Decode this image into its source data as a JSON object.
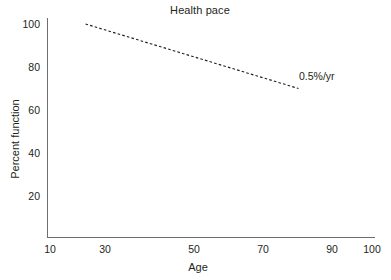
{
  "chart_data": {
    "type": "line",
    "title": "Health pace",
    "xlabel": "Age",
    "ylabel": "Percent function",
    "xlim": [
      10,
      100
    ],
    "ylim": [
      0,
      100
    ],
    "grid": false,
    "legend": "none",
    "xticks": [
      "10",
      "30",
      "50",
      "70",
      "90",
      "100"
    ],
    "yticks": [
      "20",
      "40",
      "60",
      "80",
      "100"
    ],
    "series": [
      {
        "name": "Health pace",
        "style": "dashed",
        "color": "#231f20",
        "annotation": "0.5%/yr",
        "x": [
          20,
          80
        ],
        "values": [
          100,
          70
        ]
      }
    ]
  },
  "figure": {
    "background": "#ffffff",
    "axis_color": "#6d6e71",
    "text_color": "#231f20"
  }
}
